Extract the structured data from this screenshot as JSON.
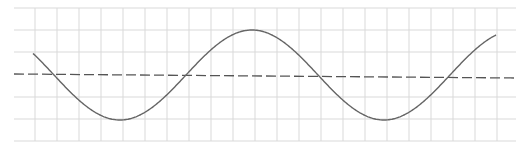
{
  "diagram": {
    "type": "sine-wave-on-grid",
    "background": "#ffffff",
    "grid": {
      "color": "#d9d9d9",
      "x_lines": [
        35,
        57,
        79,
        101,
        123,
        145,
        167,
        189,
        211,
        233,
        255,
        277,
        299,
        321,
        343,
        365,
        387,
        409,
        431,
        453,
        475,
        497
      ],
      "y_lines": [
        8,
        30,
        52,
        97,
        119,
        141
      ],
      "x_extent": [
        14,
        516
      ],
      "y_extent": [
        8,
        141
      ]
    },
    "baseline": {
      "style": "dashed",
      "color": "#555555",
      "x1": 14,
      "y1": 74,
      "x2": 516,
      "y2": 78
    },
    "curve": {
      "color": "#666666",
      "x_start": 33,
      "x_end": 496,
      "center_y": 75,
      "amplitude": 45,
      "period": 264,
      "peak_x": 252
    }
  }
}
